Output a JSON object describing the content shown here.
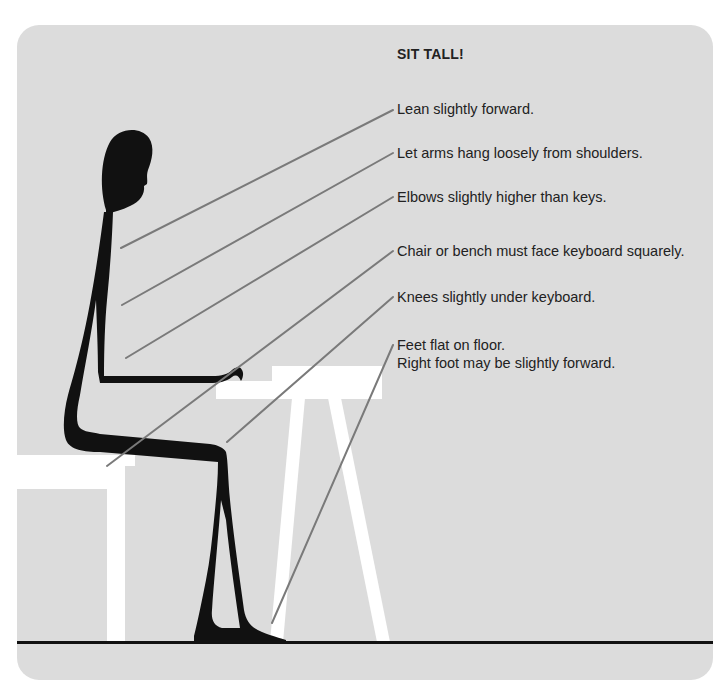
{
  "title": "SIT TALL!",
  "instructions": [
    {
      "id": "lean",
      "text": "Lean slightly forward.",
      "target": "upper-back"
    },
    {
      "id": "arms",
      "text": "Let arms hang loosely from shoulders.",
      "target": "shoulder"
    },
    {
      "id": "elbows",
      "text": "Elbows slightly higher than keys.",
      "target": "elbow"
    },
    {
      "id": "bench",
      "text": "Chair or bench must face keyboard squarely.",
      "target": "bench"
    },
    {
      "id": "knees",
      "text": "Knees slightly under keyboard.",
      "target": "knee"
    },
    {
      "id": "feet",
      "text": "Feet flat on floor.",
      "text2": "Right foot may be slightly forward.",
      "target": "foot"
    }
  ],
  "colors": {
    "panel": "#dcdcdc",
    "figure": "#111111",
    "furniture": "#ffffff",
    "leader": "#7a7a7a",
    "floor": "#111111",
    "text": "#222222"
  }
}
